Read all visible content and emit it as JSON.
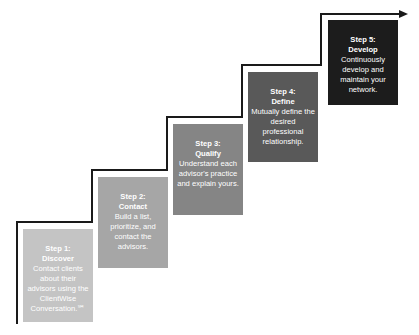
{
  "diagram": {
    "type": "staircase-process",
    "steps": [
      {
        "step": "Step 1:",
        "name": "Discover",
        "description": "Contact clients about their advisors using the ClientWise Conversation.℠",
        "color": "#c4c4c4"
      },
      {
        "step": "Step 2:",
        "name": "Contact",
        "description": "Build a list, prioritize, and contact the advisors.",
        "color": "#a6a6a6"
      },
      {
        "step": "Step 3:",
        "name": "Qualify",
        "description": "Understand each advisor's practice and explain yours.",
        "color": "#858585"
      },
      {
        "step": "Step 4:",
        "name": "Define",
        "description": "Mutually define the desired professional relationship.",
        "color": "#595959"
      },
      {
        "step": "Step 5:",
        "name": "Develop",
        "description": "Continuously develop and maintain your network.",
        "color": "#1c1c1c"
      }
    ],
    "line_color": "#1a1a1a"
  }
}
